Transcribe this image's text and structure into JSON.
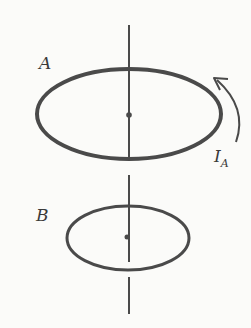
{
  "diagram": {
    "type": "two coaxial current loops",
    "colors": {
      "stroke": "#4a4a4a",
      "background": "#fbfbf9",
      "text": "#3a3a3a"
    },
    "axis": {
      "x": 129,
      "segments": [
        [
          25,
          158
        ],
        [
          175,
          262
        ],
        [
          277,
          314
        ]
      ]
    },
    "loops": [
      {
        "id": "A",
        "label": "A",
        "cx": 129,
        "cy": 114,
        "rx": 92,
        "ry": 45,
        "stroke_width": 4,
        "center_dot": true
      },
      {
        "id": "B",
        "label": "B",
        "cx": 128,
        "cy": 238,
        "rx": 61,
        "ry": 32,
        "stroke_width": 3,
        "center_dot": true
      }
    ],
    "current": {
      "label_main": "I",
      "label_sub": "A",
      "direction": "counterclockwise (arrow pointing upward along right side of loop A)"
    }
  }
}
